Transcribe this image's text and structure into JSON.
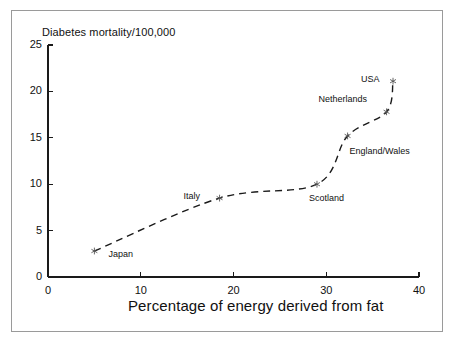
{
  "chart_data": {
    "type": "scatter",
    "title": "",
    "ylabel": "Diabetes mortality/100,000",
    "xlabel": "Percentage of energy derived from fat",
    "xlim": [
      0,
      40
    ],
    "ylim": [
      0,
      25
    ],
    "xticks": [
      "0",
      "10",
      "20",
      "30",
      "40"
    ],
    "xtick_values": [
      0,
      10,
      20,
      30,
      40
    ],
    "yticks": [
      "0",
      "5",
      "10",
      "15",
      "20",
      "25"
    ],
    "ytick_values": [
      0,
      5,
      10,
      15,
      20,
      25
    ],
    "grid": false,
    "legend": "none",
    "marker": "asterisk",
    "trendline": {
      "style": "dashed",
      "description": "fitted dashed curve rising from Japan through to USA"
    },
    "points": [
      {
        "label": "Japan",
        "x": 5.0,
        "y": 2.8,
        "label_dx": 14,
        "label_dy": 4
      },
      {
        "label": "Italy",
        "x": 18.5,
        "y": 8.5,
        "label_dx": -36,
        "label_dy": -1
      },
      {
        "label": "Scotland",
        "x": 29.0,
        "y": 10.0,
        "label_dx": -8,
        "label_dy": 15
      },
      {
        "label": "England/Wales",
        "x": 32.3,
        "y": 15.2,
        "label_dx": 2,
        "label_dy": 16
      },
      {
        "label": "Netherlands",
        "x": 36.5,
        "y": 17.8,
        "label_dx": -68,
        "label_dy": -12
      },
      {
        "label": "USA",
        "x": 37.2,
        "y": 21.1,
        "label_dx": -32,
        "label_dy": -1
      }
    ]
  },
  "axes": {
    "x_origin_px": 48,
    "x_max_px": 419,
    "y_origin_px": 277,
    "y_max_px": 45
  }
}
